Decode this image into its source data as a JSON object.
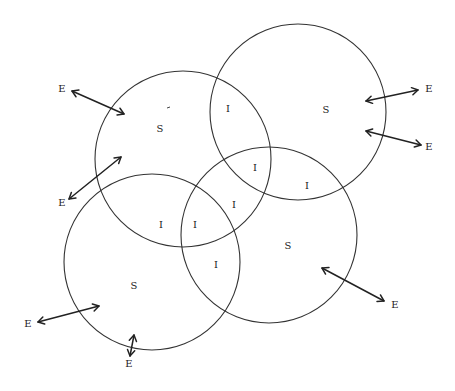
{
  "diagram": {
    "circles": [
      {
        "id": "upper-left",
        "cx": 183,
        "cy": 159,
        "r": 88,
        "label": "S",
        "label_x": 160,
        "label_y": 129
      },
      {
        "id": "upper-right",
        "cx": 298,
        "cy": 112,
        "r": 88,
        "label": "S",
        "label_x": 326,
        "label_y": 110
      },
      {
        "id": "lower-left",
        "cx": 152,
        "cy": 262,
        "r": 88,
        "label": "S",
        "label_x": 134,
        "label_y": 286
      },
      {
        "id": "lower-right",
        "cx": 269,
        "cy": 235,
        "r": 88,
        "label": "S",
        "label_x": 288,
        "label_y": 246
      }
    ],
    "interfaces": [
      {
        "label": "I",
        "x": 228,
        "y": 109
      },
      {
        "label": "I",
        "x": 255,
        "y": 168
      },
      {
        "label": "I",
        "x": 307,
        "y": 186
      },
      {
        "label": "I",
        "x": 234,
        "y": 205
      },
      {
        "label": "I",
        "x": 161,
        "y": 225
      },
      {
        "label": "I",
        "x": 195,
        "y": 225
      },
      {
        "label": "I",
        "x": 216,
        "y": 265
      }
    ],
    "environment": [
      {
        "label": "E",
        "x": 62,
        "y": 89,
        "arrow": [
          72,
          91,
          124,
          114
        ]
      },
      {
        "label": "E",
        "x": 62,
        "y": 203,
        "arrow": [
          69,
          199,
          121,
          157
        ]
      },
      {
        "label": "E",
        "x": 429,
        "y": 89,
        "arrow": [
          366,
          101,
          418,
          90
        ]
      },
      {
        "label": "E",
        "x": 429,
        "y": 147,
        "arrow": [
          366,
          131,
          421,
          145
        ]
      },
      {
        "label": "E",
        "x": 395,
        "y": 305,
        "arrow": [
          322,
          268,
          384,
          301
        ]
      },
      {
        "label": "E",
        "x": 28,
        "y": 324,
        "arrow": [
          38,
          322,
          99,
          306
        ]
      },
      {
        "label": "E",
        "x": 129,
        "y": 364,
        "arrow": [
          130,
          356,
          134,
          335
        ]
      }
    ]
  }
}
